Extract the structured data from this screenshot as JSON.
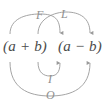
{
  "figure": {
    "expression": {
      "left_group": "(a + b)",
      "right_group": "(a − b)",
      "full": "(a + b) (a − b)"
    },
    "stroke_color": "#9a9a9a",
    "label_color": "#8f8f8f",
    "text_color": "#4a4a4a",
    "background_color": "#ffffff",
    "arcs": [
      {
        "label": "F",
        "meaning": "First",
        "position": "above",
        "from_term": "a",
        "to_term": "a"
      },
      {
        "label": "L",
        "meaning": "Last",
        "position": "above",
        "from_term": "b",
        "to_term": "b"
      },
      {
        "label": "I",
        "meaning": "Inner",
        "position": "below",
        "from_term": "b",
        "to_term": "a"
      },
      {
        "label": "O",
        "meaning": "Outer",
        "position": "below",
        "from_term": "a",
        "to_term": "b"
      }
    ]
  }
}
